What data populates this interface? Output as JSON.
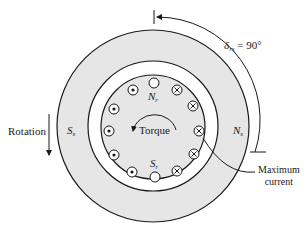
{
  "figure": {
    "type": "synchronous machine cross-section",
    "colors": {
      "stator_fill": "#e6e6e6",
      "airgap_fill": "#ffffff",
      "rotor_fill": "#e6e6e6",
      "line": "#1a1a1a"
    }
  },
  "labels": {
    "angle_symbol": "δ",
    "angle_subscript": "rs",
    "angle_value": " = 90°",
    "rotation": "Rotation",
    "stator_south": "S",
    "stator_south_sub": "s",
    "stator_north": "N",
    "stator_north_sub": "s",
    "rotor_north": "N",
    "rotor_north_sub": "r",
    "rotor_south": "S",
    "rotor_south_sub": "r",
    "torque": "Torque",
    "max_current_line1": "Maximum",
    "max_current_line2": "current"
  },
  "conductors": {
    "dot": [
      [
        133,
        90
      ],
      [
        114,
        109
      ],
      [
        109,
        131
      ],
      [
        114,
        155
      ],
      [
        132,
        172
      ]
    ],
    "cross": [
      [
        177,
        90
      ],
      [
        193,
        106
      ],
      [
        199,
        131
      ],
      [
        194,
        154
      ],
      [
        177,
        171
      ]
    ],
    "empty": [
      [
        154,
        83
      ],
      [
        155,
        177
      ]
    ]
  }
}
